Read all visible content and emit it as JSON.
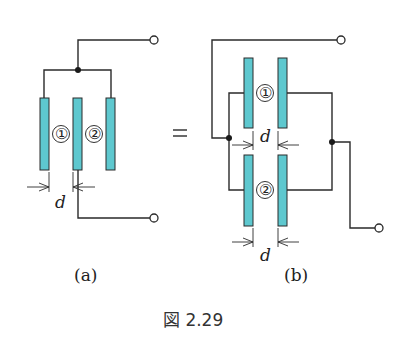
{
  "figure": {
    "caption": "図 2.29",
    "equals_sign": "=",
    "colors": {
      "plate_fill": "#5ec8cf",
      "wire": "#2a2a2a",
      "background": "#ffffff"
    }
  },
  "panel_a": {
    "label": "(a)",
    "capacitor_labels": [
      "①",
      "②"
    ],
    "dimension_label": "d",
    "description": "Three parallel plates; outer two plates joined at top node to upper terminal, middle plate to lower terminal"
  },
  "panel_b": {
    "label": "(b)",
    "capacitor_labels": [
      "①",
      "②"
    ],
    "dimension_labels": [
      "d",
      "d"
    ],
    "description": "Two parallel-plate capacitors connected in parallel between two terminals"
  }
}
